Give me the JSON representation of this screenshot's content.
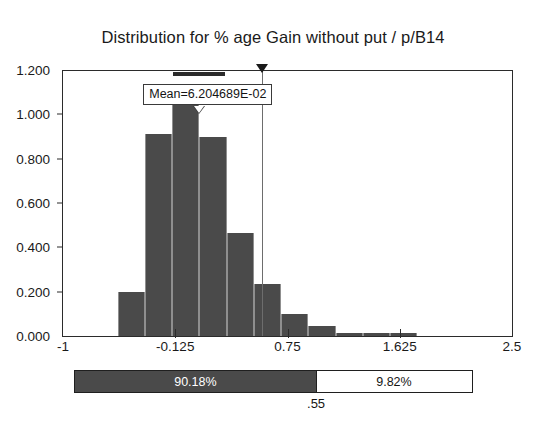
{
  "chart_data": {
    "type": "bar",
    "title": "Distribution for % age Gain without put / p/B14",
    "xlabel": "",
    "ylabel": "",
    "xlim": [
      -1,
      2.5
    ],
    "ylim": [
      0,
      1.2
    ],
    "grid": false,
    "legend": "none",
    "x_ticks": [
      "-1",
      "-0.125",
      "0.75",
      "1.625",
      "2.5"
    ],
    "x_tick_values": [
      -1,
      -0.125,
      0.75,
      1.625,
      2.5
    ],
    "y_ticks": [
      "0.000",
      "0.200",
      "0.400",
      "0.600",
      "0.800",
      "1.000",
      "1.200"
    ],
    "y_tick_values": [
      0,
      0.2,
      0.4,
      0.6,
      0.8,
      1.0,
      1.2
    ],
    "bin_edges": [
      -0.575,
      -0.3625,
      -0.15,
      0.0625,
      0.275,
      0.4875,
      0.7,
      0.9125,
      1.125,
      1.3375,
      1.55,
      1.7625
    ],
    "categories": [
      "-0.47",
      "-0.26",
      "-0.04",
      "0.17",
      "0.38",
      "0.59",
      "0.81",
      "1.02",
      "1.23",
      "1.44",
      "1.66"
    ],
    "values": [
      0.2,
      0.91,
      1.1,
      0.9,
      0.465,
      0.235,
      0.1,
      0.045,
      0.012,
      0.012,
      0.012
    ],
    "annotations": [
      {
        "name": "mean-label",
        "text": "Mean=6.204689E-02",
        "value": 0.06204689
      },
      {
        "name": "delimiter",
        "text": ".55",
        "value": 0.55
      }
    ]
  },
  "title": {
    "text": "Distribution for % age Gain without put / p/B14"
  },
  "mean_callout": {
    "label": "Mean=6.204689E-02"
  },
  "axes": {
    "y": {
      "labels": [
        "1.200",
        "1.000",
        "0.800",
        "0.600",
        "0.400",
        "0.200",
        "0.000"
      ]
    },
    "x": {
      "labels": [
        "-1",
        "-0.125",
        "0.75",
        "1.625",
        "2.5"
      ]
    }
  },
  "percent_bar": {
    "left_label": "90.18%",
    "right_label": "9.82%",
    "boundary_label": ".55",
    "left_fraction": 0.6067,
    "colors": {
      "left_fill": "#4a4a4a",
      "right_fill": "#ffffff",
      "border": "#1f1f1f"
    }
  },
  "colors": {
    "bar_fill": "#4a4a4a",
    "bar_edge": "#8f8f8f",
    "axis": "#2b2b2b",
    "text": "#1a1a1a",
    "background": "#ffffff",
    "slider_line": "#6d6d6d"
  }
}
